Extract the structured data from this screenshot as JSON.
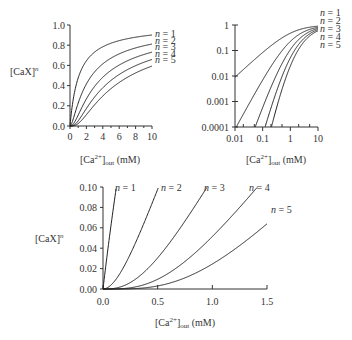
{
  "chart_data": [
    {
      "type": "line",
      "id": "linear-full",
      "xlabel": "[Ca2+]out (mM)",
      "ylabel": "[CaX]^n",
      "xlim": [
        0,
        10
      ],
      "ylim": [
        0,
        1.0
      ],
      "xscale": "linear",
      "yscale": "linear",
      "x_ticks": [
        0,
        2,
        4,
        6,
        8,
        10
      ],
      "x_tick_labels": [
        "0",
        "2",
        "4",
        "6",
        "8",
        "10"
      ],
      "y_ticks": [
        0,
        0.2,
        0.4,
        0.6,
        0.8,
        1.0
      ],
      "y_tick_labels": [
        "0.0",
        "0.2",
        "0.4",
        "0.6",
        "0.8",
        "1.0"
      ],
      "grid": false,
      "legend_position": "right (inline labels)",
      "model": "[CaX]^n where [CaX] = c/(c + 1.1)",
      "x": [
        0,
        0.5,
        1,
        2,
        3,
        4,
        5,
        6,
        7,
        8,
        9,
        10
      ],
      "series": [
        {
          "name": "n = 1",
          "values": [
            0.0,
            0.31,
            0.48,
            0.65,
            0.73,
            0.78,
            0.82,
            0.85,
            0.86,
            0.88,
            0.89,
            0.9
          ]
        },
        {
          "name": "n = 2",
          "values": [
            0.0,
            0.1,
            0.23,
            0.42,
            0.54,
            0.61,
            0.67,
            0.71,
            0.75,
            0.77,
            0.79,
            0.81
          ]
        },
        {
          "name": "n = 3",
          "values": [
            0.0,
            0.03,
            0.11,
            0.27,
            0.39,
            0.48,
            0.55,
            0.61,
            0.64,
            0.68,
            0.71,
            0.73
          ]
        },
        {
          "name": "n = 4",
          "values": [
            0.0,
            0.01,
            0.05,
            0.17,
            0.29,
            0.37,
            0.45,
            0.52,
            0.56,
            0.6,
            0.63,
            0.66
          ]
        },
        {
          "name": "n = 5",
          "values": [
            0.0,
            0.0,
            0.03,
            0.11,
            0.21,
            0.29,
            0.37,
            0.44,
            0.48,
            0.53,
            0.56,
            0.59
          ]
        }
      ]
    },
    {
      "type": "line",
      "id": "log-log",
      "xlabel": "[Ca2+]out (mM)",
      "ylabel": "[CaX]^n",
      "xlim": [
        0.01,
        10
      ],
      "ylim": [
        0.0001,
        1
      ],
      "xscale": "log",
      "yscale": "log",
      "x_ticks": [
        0.01,
        0.1,
        1,
        10
      ],
      "x_tick_labels": [
        "0.01",
        "0.1",
        "1",
        "10"
      ],
      "y_ticks": [
        0.0001,
        0.001,
        0.01,
        0.1,
        1
      ],
      "y_tick_labels": [
        "0.0001",
        "0.001",
        "0.01",
        "0.1",
        "1"
      ],
      "grid": false,
      "legend_position": "top-right (inline labels)",
      "model": "[CaX]^n where [CaX] = c/(c + 1.1)",
      "x": [
        0.01,
        0.03,
        0.1,
        0.3,
        1,
        3,
        10
      ],
      "series": [
        {
          "name": "n = 1",
          "values": [
            0.009,
            0.027,
            0.083,
            0.21,
            0.48,
            0.73,
            0.9
          ]
        },
        {
          "name": "n = 2",
          "values": [
            0.0001,
            0.0007,
            0.0069,
            0.046,
            0.23,
            0.54,
            0.81
          ]
        },
        {
          "name": "n = 3",
          "values": [
            null,
            2e-05,
            0.00057,
            0.0097,
            0.11,
            0.39,
            0.73
          ]
        },
        {
          "name": "n = 4",
          "values": [
            null,
            null,
            5e-05,
            0.002,
            0.053,
            0.29,
            0.66
          ]
        },
        {
          "name": "n = 5",
          "values": [
            null,
            null,
            4e-06,
            0.0004,
            0.025,
            0.21,
            0.59
          ]
        }
      ]
    },
    {
      "type": "line",
      "id": "linear-zoom",
      "xlabel": "[Ca2+]out (mM)",
      "ylabel": "[CaX]^n",
      "xlim": [
        0,
        1.5
      ],
      "ylim": [
        0,
        0.1
      ],
      "xscale": "linear",
      "yscale": "linear",
      "x_ticks": [
        0,
        0.5,
        1.0,
        1.5
      ],
      "x_tick_labels": [
        "0.0",
        "0.5",
        "1.0",
        "1.5"
      ],
      "y_ticks": [
        0,
        0.02,
        0.04,
        0.06,
        0.08,
        0.1
      ],
      "y_tick_labels": [
        "0.00",
        "0.02",
        "0.04",
        "0.06",
        "0.08",
        "0.10"
      ],
      "grid": false,
      "legend_position": "inline at curve ends",
      "model": "[CaX]^n where [CaX] = c/(c + 1.1)",
      "x": [
        0,
        0.1,
        0.25,
        0.5,
        0.75,
        1.0,
        1.25,
        1.5
      ],
      "series": [
        {
          "name": "n = 1",
          "values": [
            0.0,
            0.083,
            null,
            null,
            null,
            null,
            null,
            null
          ]
        },
        {
          "name": "n = 2",
          "values": [
            0.0,
            0.007,
            0.034,
            0.098,
            null,
            null,
            null,
            null
          ]
        },
        {
          "name": "n = 3",
          "values": [
            0.0,
            0.0006,
            0.0063,
            0.031,
            0.068,
            null,
            null,
            null
          ]
        },
        {
          "name": "n = 4",
          "values": [
            0.0,
            5e-05,
            0.0012,
            0.0095,
            0.028,
            0.053,
            0.085,
            null
          ]
        },
        {
          "name": "n = 5",
          "values": [
            0.0,
            4e-06,
            0.0002,
            0.003,
            0.011,
            0.025,
            0.045,
            0.077
          ]
        }
      ]
    }
  ],
  "labels": {
    "ylabel_base": "[CaX]",
    "ylabel_sup": "n",
    "xlabel_pre": "[Ca",
    "xlabel_sup": "2+",
    "xlabel_mid": "]",
    "xlabel_sub": "out",
    "xlabel_post": " (mM)",
    "series_names": [
      "n = 1",
      "n = 2",
      "n = 3",
      "n = 4",
      "n = 5"
    ]
  },
  "colors": {
    "line": "#222222",
    "axis": "#333333",
    "background": "#ffffff"
  }
}
